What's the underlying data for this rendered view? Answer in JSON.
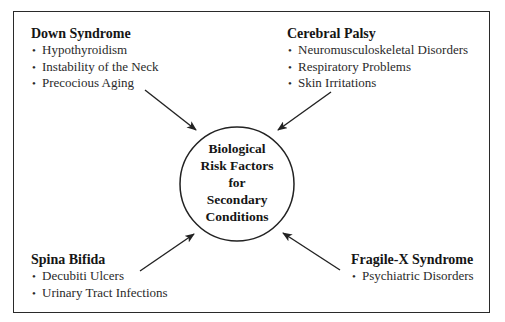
{
  "diagram": {
    "center": {
      "label_lines": [
        "Biological",
        "Risk Factors",
        "for",
        "Secondary",
        "Conditions"
      ]
    },
    "groups": [
      {
        "id": "down-syndrome",
        "title": "Down Syndrome",
        "items": [
          "Hypothyroidism",
          "Instability of the Neck",
          "Precocious Aging"
        ]
      },
      {
        "id": "cerebral-palsy",
        "title": "Cerebral Palsy",
        "items": [
          "Neuromusculoskeletal Disorders",
          "Respiratory Problems",
          "Skin Irritations"
        ]
      },
      {
        "id": "spina-bifida",
        "title": "Spina Bifida",
        "items": [
          "Decubiti Ulcers",
          "Urinary Tract Infections"
        ]
      },
      {
        "id": "fragile-x-syndrome",
        "title": "Fragile-X Syndrome",
        "items": [
          "Psychiatric Disorders"
        ]
      }
    ],
    "bullet_glyph": "•",
    "colors": {
      "line": "#222222",
      "text": "#1e1e1e",
      "background": "#ffffff"
    }
  }
}
